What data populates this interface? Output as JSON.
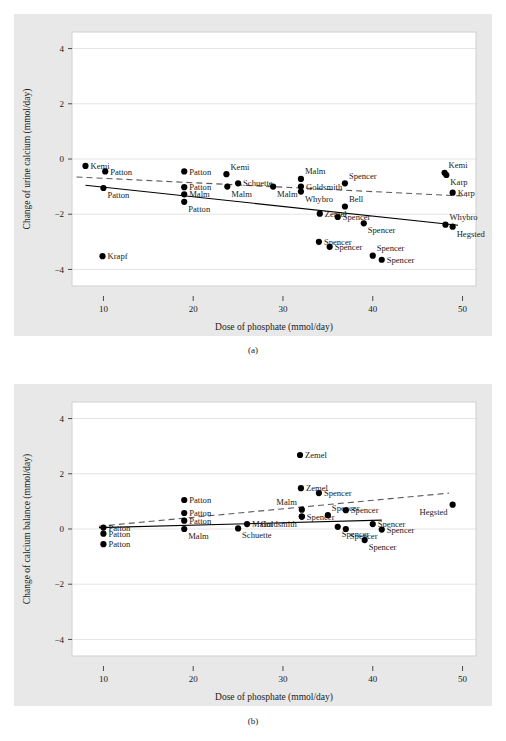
{
  "figure": {
    "panel_a_caption": "(a)",
    "panel_b_caption": "(b)"
  },
  "chart_data": [
    {
      "id": "panel-a",
      "type": "scatter",
      "title": "",
      "xlabel": "Dose of phosphate (mmol/day)",
      "ylabel": "Change of urine calcium (mmol/day)",
      "xlim": [
        6.5,
        51.5
      ],
      "ylim": [
        -4.6,
        4.6
      ],
      "xticks": [
        10,
        20,
        30,
        40,
        50
      ],
      "yticks": [
        4,
        2,
        0,
        -2,
        -4
      ],
      "grid": true,
      "legend": "none",
      "points": [
        {
          "label": "Kemi",
          "x": 8.0,
          "y": -0.25,
          "label_pos": "right"
        },
        {
          "label": "Patton",
          "x": 10.2,
          "y": -0.45,
          "label_pos": "right"
        },
        {
          "label": "Patton",
          "x": 10.0,
          "y": -1.05,
          "label_pos": "below-right"
        },
        {
          "label": "Krapf",
          "x": 9.9,
          "y": -3.52,
          "label_pos": "right"
        },
        {
          "label": "Patton",
          "x": 19.0,
          "y": -0.45,
          "label_pos": "right"
        },
        {
          "label": "Patton",
          "x": 19.0,
          "y": -1.02,
          "label_pos": "right"
        },
        {
          "label": "Malm",
          "x": 19.0,
          "y": -1.28,
          "label_pos": "right"
        },
        {
          "label": "Patton",
          "x": 19.0,
          "y": -1.55,
          "label_pos": "below-right"
        },
        {
          "label": "Kemi",
          "x": 23.7,
          "y": -0.55,
          "label_pos": "above-right"
        },
        {
          "label": "Malm",
          "x": 23.8,
          "y": -1.0,
          "label_pos": "below-right"
        },
        {
          "label": "Schuette",
          "x": 25.0,
          "y": -0.88,
          "label_pos": "right"
        },
        {
          "label": "Malm",
          "x": 28.9,
          "y": -1.0,
          "label_pos": "below-right"
        },
        {
          "label": "Malm",
          "x": 32.0,
          "y": -0.72,
          "label_pos": "above-right"
        },
        {
          "label": "Goldsmith",
          "x": 32.0,
          "y": -1.0,
          "label_pos": "right"
        },
        {
          "label": "Whybro",
          "x": 32.0,
          "y": -1.18,
          "label_pos": "below-right"
        },
        {
          "label": "Spencer",
          "x": 36.9,
          "y": -0.88,
          "label_pos": "above-right"
        },
        {
          "label": "Bell",
          "x": 36.9,
          "y": -1.72,
          "label_pos": "above-right"
        },
        {
          "label": "Zemel",
          "x": 34.1,
          "y": -1.98,
          "label_pos": "right"
        },
        {
          "label": "Spencer",
          "x": 36.1,
          "y": -2.1,
          "label_pos": "right"
        },
        {
          "label": "Spencer",
          "x": 39.0,
          "y": -2.33,
          "label_pos": "below-right"
        },
        {
          "label": "Spencer",
          "x": 34.0,
          "y": -3.0,
          "label_pos": "right"
        },
        {
          "label": "Spencer",
          "x": 35.2,
          "y": -3.18,
          "label_pos": "right"
        },
        {
          "label": "Spencer",
          "x": 40.0,
          "y": -3.5,
          "label_pos": "above-right"
        },
        {
          "label": "Spencer",
          "x": 41.0,
          "y": -3.65,
          "label_pos": "right"
        },
        {
          "label": "Kemi",
          "x": 48.0,
          "y": -0.5,
          "label_pos": "above-right"
        },
        {
          "label": "Karp",
          "x": 48.2,
          "y": -0.58,
          "label_pos": "below-right"
        },
        {
          "label": "Karp",
          "x": 48.9,
          "y": -1.22,
          "label_pos": "right"
        },
        {
          "label": "Whybro",
          "x": 48.1,
          "y": -2.38,
          "label_pos": "above-right"
        },
        {
          "label": "Hegsted",
          "x": 48.9,
          "y": -2.45,
          "label_pos": "below-right"
        }
      ],
      "lines": [
        {
          "name": "solid-fit",
          "style": "solid",
          "x1": 8.0,
          "y1": -0.95,
          "x2": 49.5,
          "y2": -2.4
        },
        {
          "name": "dashed-fit",
          "style": "dashed",
          "x1": 7.0,
          "y1": -0.65,
          "x2": 50.5,
          "y2": -1.35
        }
      ]
    },
    {
      "id": "panel-b",
      "type": "scatter",
      "title": "",
      "xlabel": "Dose of phosphate (mmol/day)",
      "ylabel": "Change of calcium balance (mmol/day)",
      "xlim": [
        6.5,
        51.5
      ],
      "ylim": [
        -4.6,
        4.6
      ],
      "xticks": [
        10,
        20,
        30,
        40,
        50
      ],
      "yticks": [
        4,
        2,
        0,
        -2,
        -4
      ],
      "grid": true,
      "legend": "none",
      "points": [
        {
          "label": "Patton",
          "x": 10.0,
          "y": 0.05,
          "label_pos": "right"
        },
        {
          "label": "Patton",
          "x": 10.0,
          "y": -0.17,
          "label_pos": "right"
        },
        {
          "label": "Patton",
          "x": 10.0,
          "y": -0.55,
          "label_pos": "right"
        },
        {
          "label": "Patton",
          "x": 19.0,
          "y": 1.05,
          "label_pos": "right"
        },
        {
          "label": "Patton",
          "x": 19.0,
          "y": 0.58,
          "label_pos": "right"
        },
        {
          "label": "Patton",
          "x": 19.0,
          "y": 0.3,
          "label_pos": "right"
        },
        {
          "label": "Malm",
          "x": 19.0,
          "y": 0.0,
          "label_pos": "below-right"
        },
        {
          "label": "Schuette",
          "x": 25.0,
          "y": 0.02,
          "label_pos": "below-right"
        },
        {
          "label": "Malm",
          "x": 26.0,
          "y": 0.18,
          "label_pos": "right"
        },
        {
          "label": "Zemel",
          "x": 31.9,
          "y": 2.68,
          "label_pos": "right"
        },
        {
          "label": "Zemel",
          "x": 32.0,
          "y": 1.48,
          "label_pos": "right"
        },
        {
          "label": "Spencer",
          "x": 34.0,
          "y": 1.3,
          "label_pos": "right"
        },
        {
          "label": "Malm",
          "x": 32.1,
          "y": 0.7,
          "label_pos": "above-left"
        },
        {
          "label": "Spencer",
          "x": 32.1,
          "y": 0.45,
          "label_pos": "right"
        },
        {
          "label": "Goldsmith",
          "x": 32.1,
          "y": 0.45,
          "label_pos": "below-left"
        },
        {
          "label": "Spencer",
          "x": 35.0,
          "y": 0.5,
          "label_pos": "above-right"
        },
        {
          "label": "Spencer",
          "x": 37.0,
          "y": 0.68,
          "label_pos": "right"
        },
        {
          "label": "Spencer",
          "x": 36.1,
          "y": 0.08,
          "label_pos": "below-right"
        },
        {
          "label": "Spencer",
          "x": 37.0,
          "y": 0.0,
          "label_pos": "below-right"
        },
        {
          "label": "Spencer",
          "x": 40.0,
          "y": 0.18,
          "label_pos": "right"
        },
        {
          "label": "Spencer",
          "x": 41.0,
          "y": -0.02,
          "label_pos": "right"
        },
        {
          "label": "Spencer",
          "x": 39.1,
          "y": -0.4,
          "label_pos": "below-right"
        },
        {
          "label": "Hegsted",
          "x": 48.9,
          "y": 0.88,
          "label_pos": "below-left"
        }
      ],
      "lines": [
        {
          "name": "solid-fit",
          "style": "solid",
          "x1": 9.5,
          "y1": 0.05,
          "x2": 41.0,
          "y2": 0.32
        },
        {
          "name": "dashed-fit",
          "style": "dashed",
          "x1": 9.5,
          "y1": 0.1,
          "x2": 48.5,
          "y2": 1.3
        }
      ]
    }
  ]
}
